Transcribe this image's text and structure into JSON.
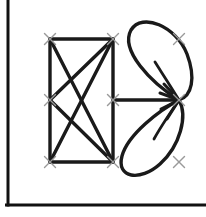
{
  "canvas": {
    "width": 206,
    "height": 217,
    "background_color": "#ffffff",
    "title": "Sketch Canvas"
  },
  "colors": {
    "stroke": "#1a1a1a",
    "ink": "#222222",
    "marker": "#9a9a9a",
    "frame": "#111111",
    "background": "#ffffff"
  },
  "frame": {
    "name": "L-shaped border",
    "style": "left-and-bottom",
    "stroke_width": 3,
    "left_x": 8,
    "bottom_y": 205,
    "top_y": 0,
    "right_x": 206
  },
  "markers": {
    "glyph": "x",
    "size": 11,
    "stroke_width": 1.4,
    "color": "#9a9a9a",
    "points": [
      {
        "id": "m-top-left",
        "label": "top-left",
        "x": 50,
        "y": 39
      },
      {
        "id": "m-top-mid",
        "label": "top-middle",
        "x": 113,
        "y": 39
      },
      {
        "id": "m-top-right",
        "label": "top-right",
        "x": 179,
        "y": 39
      },
      {
        "id": "m-mid-left",
        "label": "middle-left",
        "x": 50,
        "y": 100
      },
      {
        "id": "m-mid-mid",
        "label": "middle-middle",
        "x": 113,
        "y": 100
      },
      {
        "id": "m-mid-right",
        "label": "middle-right",
        "x": 179,
        "y": 100
      },
      {
        "id": "m-bot-left",
        "label": "bottom-left",
        "x": 50,
        "y": 162
      },
      {
        "id": "m-bot-mid",
        "label": "bottom-middle",
        "x": 113,
        "y": 162
      },
      {
        "id": "m-bot-right",
        "label": "bottom-right",
        "x": 179,
        "y": 162
      }
    ]
  },
  "polyline_figure": {
    "name": "left-polygon-network",
    "stroke_width": 3.4,
    "segments": [
      {
        "id": "seg-top",
        "label": "top edge",
        "x1": 50,
        "y1": 39,
        "x2": 113,
        "y2": 39
      },
      {
        "id": "seg-right",
        "label": "right edge",
        "x1": 113,
        "y1": 39,
        "x2": 113,
        "y2": 162
      },
      {
        "id": "seg-bottom",
        "label": "bottom edge",
        "x1": 50,
        "y1": 162,
        "x2": 113,
        "y2": 162
      },
      {
        "id": "seg-left-upper",
        "label": "left upper edge",
        "x1": 50,
        "y1": 39,
        "x2": 50,
        "y2": 100
      },
      {
        "id": "seg-left-lower",
        "label": "left lower edge",
        "x1": 50,
        "y1": 100,
        "x2": 50,
        "y2": 162
      },
      {
        "id": "seg-diag-a",
        "label": "diagonal top-left to bottom-middle",
        "x1": 50,
        "y1": 39,
        "x2": 113,
        "y2": 162
      },
      {
        "id": "seg-diag-b",
        "label": "diagonal top-middle to middle-left",
        "x1": 113,
        "y1": 39,
        "x2": 50,
        "y2": 100
      },
      {
        "id": "seg-diag-c",
        "label": "diagonal top-middle to bottom-left",
        "x1": 113,
        "y1": 39,
        "x2": 50,
        "y2": 162
      },
      {
        "id": "seg-chevron",
        "label": "middle-left to bottom-middle",
        "x1": 50,
        "y1": 100,
        "x2": 113,
        "y2": 162
      },
      {
        "id": "seg-cross-bar",
        "label": "middle horizontal to hub",
        "x1": 113,
        "y1": 100,
        "x2": 179,
        "y2": 100
      }
    ]
  },
  "petals": {
    "name": "leaf-pair",
    "stroke_width": 3.4,
    "hub": {
      "x": 179,
      "y": 100,
      "label": "convergence hub"
    },
    "shapes": [
      {
        "id": "petal-upper",
        "label": "upper leaf",
        "outline": "M179,100 C150,82 120,50 131,30 C142,12 176,26 187,54 C196,78 192,96 179,100 Z",
        "vein": "M179,100 C168,82 160,70 155,62"
      },
      {
        "id": "petal-lower",
        "label": "lower leaf",
        "outline": "M179,100 C160,110 128,134 122,156 C116,178 140,182 160,164 C180,146 188,116 179,100 Z",
        "vein": "M179,100 C168,116 160,128 154,139"
      }
    ]
  },
  "hub_rays": {
    "name": "hub-radiating-strokes",
    "stroke_width": 3.0,
    "rays": [
      {
        "id": "ray-up",
        "label": "ray upper",
        "x1": 179,
        "y1": 100,
        "x2": 164,
        "y2": 84
      },
      {
        "id": "ray-up-left",
        "label": "ray upper left",
        "x1": 179,
        "y1": 100,
        "x2": 160,
        "y2": 93
      },
      {
        "id": "ray-down-left",
        "label": "ray lower left",
        "x1": 179,
        "y1": 100,
        "x2": 161,
        "y2": 109
      },
      {
        "id": "ray-down",
        "label": "ray lower",
        "x1": 179,
        "y1": 100,
        "x2": 167,
        "y2": 119
      }
    ]
  }
}
